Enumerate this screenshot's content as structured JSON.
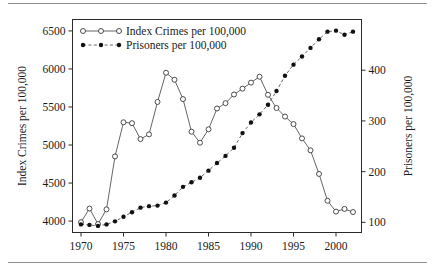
{
  "figure": {
    "has_top_rule": true,
    "has_bottom_rule": true
  },
  "chart_data": {
    "type": "line",
    "title": "",
    "xlabel": "",
    "ylabel": "Index Crimes per 100,000",
    "y2label": "Prisoners per 100,000",
    "grid": false,
    "legend_position": "top-left",
    "xlim": [
      1969,
      2003
    ],
    "ylim": [
      3850,
      6650
    ],
    "y2lim": [
      80,
      500
    ],
    "xticks": [
      1970,
      1975,
      1980,
      1985,
      1990,
      1995,
      2000
    ],
    "xtick_labels": [
      "1970",
      "1975",
      "1980",
      "1985",
      "1990",
      "1995",
      "2000"
    ],
    "yticks": [
      4000,
      4500,
      5000,
      5500,
      6000,
      6500
    ],
    "ytick_labels": [
      "4000",
      "4500",
      "5000",
      "5500",
      "6000",
      "6500"
    ],
    "y2ticks": [
      100,
      200,
      300,
      400
    ],
    "y2tick_labels": [
      "100",
      "200",
      "300",
      "400"
    ],
    "x": [
      1970,
      1971,
      1972,
      1973,
      1974,
      1975,
      1976,
      1977,
      1978,
      1979,
      1980,
      1981,
      1982,
      1983,
      1984,
      1985,
      1986,
      1987,
      1988,
      1989,
      1990,
      1991,
      1992,
      1993,
      1994,
      1995,
      1996,
      1997,
      1998,
      1999,
      2000,
      2001,
      2002
    ],
    "series": [
      {
        "name": "Index Crimes per 100,000",
        "axis": "left",
        "marker": "open-circle",
        "linestyle": "solid",
        "values": [
          3985,
          4165,
          3961,
          4154,
          4850,
          5299,
          5287,
          5078,
          5140,
          5566,
          5950,
          5858,
          5604,
          5175,
          5031,
          5207,
          5480,
          5550,
          5664,
          5741,
          5820,
          5898,
          5660,
          5487,
          5374,
          5275,
          5087,
          4930,
          4620,
          4267,
          4125,
          4160,
          4119
        ]
      },
      {
        "name": "Prisoners per 100,000",
        "axis": "right",
        "marker": "filled-circle",
        "linestyle": "dashed",
        "values": [
          96,
          95,
          93,
          96,
          102,
          111,
          120,
          129,
          132,
          133,
          139,
          153,
          170,
          179,
          188,
          202,
          217,
          231,
          247,
          276,
          297,
          313,
          332,
          359,
          389,
          411,
          427,
          444,
          461,
          476,
          478,
          470,
          476
        ]
      }
    ],
    "legend": [
      {
        "label": "Index Crimes per 100,000",
        "marker": "open-circle",
        "linestyle": "solid"
      },
      {
        "label": "Prisoners per 100,000",
        "marker": "filled-circle",
        "linestyle": "dashed"
      }
    ]
  }
}
